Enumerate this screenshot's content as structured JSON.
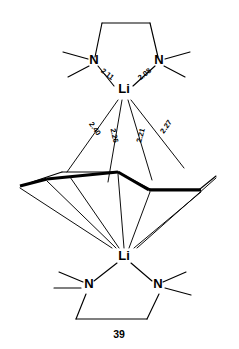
{
  "header": {
    "running_title": "THE CHEMISTRY AND PHYSICS OF X-RAYS SOURCES"
  },
  "figure": {
    "number": "39",
    "caption": "",
    "atoms": {
      "lithium_top": "Li",
      "lithium_bottom": "Li",
      "nitrogen_top_left": "N",
      "nitrogen_top_right": "N",
      "nitrogen_bottom_left": "N",
      "nitrogen_bottom_right": "N"
    },
    "distances": {
      "n_left_li_top": "2.11",
      "n_right_li_top": "2.08",
      "li_top_ring_c1": "2.40",
      "li_top_ring_c2": "2.26",
      "li_top_ring_c3": "2.21",
      "li_top_ring_c4": "2.27"
    }
  }
}
